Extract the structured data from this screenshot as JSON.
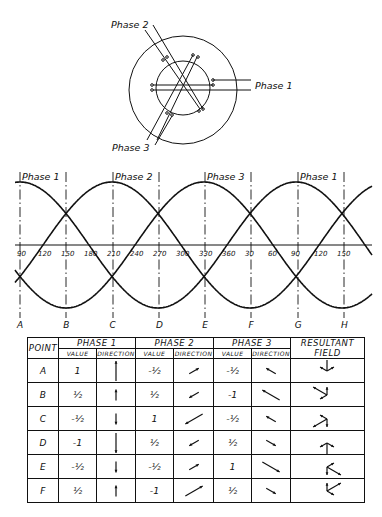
{
  "diagram": {
    "stator_labels": {
      "phase1": "Phase 1",
      "phase2": "Phase 2",
      "phase3": "Phase 3"
    }
  },
  "waveform": {
    "phase_labels": [
      {
        "text": "Phase 1",
        "x": 20
      },
      {
        "text": "Phase 2",
        "x": 113
      },
      {
        "text": "Phase 3",
        "x": 205
      },
      {
        "text": "Phase 1",
        "x": 298
      }
    ],
    "degree_ticks": [
      "90",
      "120",
      "150",
      "180",
      "210",
      "240",
      "270",
      "300",
      "330",
      "360",
      "30",
      "60",
      "90",
      "120",
      "150"
    ],
    "points": [
      "A",
      "B",
      "C",
      "D",
      "E",
      "F",
      "G",
      "H"
    ]
  },
  "table": {
    "headers": {
      "point": "POINT",
      "phase1": "PHASE 1",
      "phase2": "PHASE 2",
      "phase3": "PHASE 3",
      "resultant": "RESULTANT FIELD",
      "value": "VALUE",
      "direction": "DIRECTION"
    },
    "rows": [
      {
        "point": "A",
        "p1": "1",
        "p2": "-½",
        "p3": "-½"
      },
      {
        "point": "B",
        "p1": "½",
        "p2": "½",
        "p3": "-1"
      },
      {
        "point": "C",
        "p1": "-½",
        "p2": "1",
        "p3": "-½"
      },
      {
        "point": "D",
        "p1": "-1",
        "p2": "½",
        "p3": "½"
      },
      {
        "point": "E",
        "p1": "-½",
        "p2": "-½",
        "p3": "1"
      },
      {
        "point": "F",
        "p1": "½",
        "p2": "-1",
        "p3": "½"
      }
    ]
  }
}
